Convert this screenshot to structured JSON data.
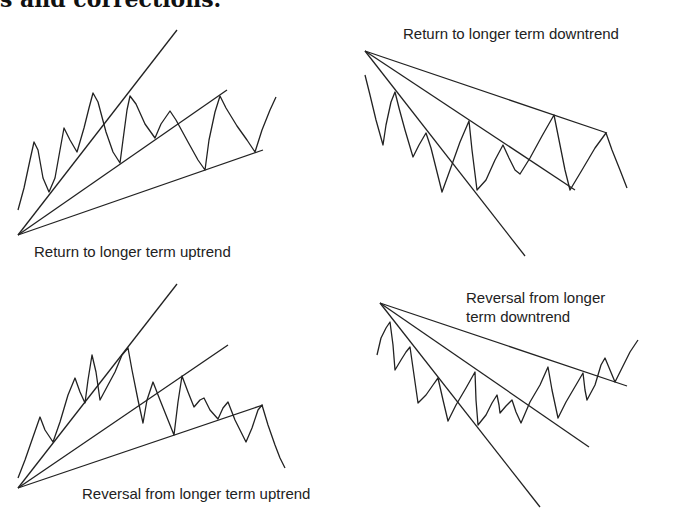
{
  "heading": "s and corrections.",
  "panels": [
    {
      "id": "return-uptrend",
      "caption": "Return to longer term uptrend",
      "caption_pos": [
        34,
        242
      ],
      "origin": [
        18,
        235
      ],
      "trendlines": [
        [
          177,
          30
        ],
        [
          227,
          90
        ],
        [
          263,
          150
        ]
      ],
      "price": [
        [
          18,
          210
        ],
        [
          24,
          188
        ],
        [
          30,
          160
        ],
        [
          34,
          142
        ],
        [
          38,
          150
        ],
        [
          43,
          178
        ],
        [
          49,
          192
        ],
        [
          55,
          178
        ],
        [
          60,
          150
        ],
        [
          64,
          128
        ],
        [
          70,
          140
        ],
        [
          77,
          152
        ],
        [
          84,
          128
        ],
        [
          89,
          108
        ],
        [
          93,
          93
        ],
        [
          98,
          102
        ],
        [
          106,
          132
        ],
        [
          113,
          152
        ],
        [
          120,
          163
        ],
        [
          123,
          140
        ],
        [
          127,
          110
        ],
        [
          130,
          96
        ],
        [
          136,
          104
        ],
        [
          145,
          124
        ],
        [
          155,
          138
        ],
        [
          161,
          124
        ],
        [
          170,
          111
        ],
        [
          176,
          120
        ],
        [
          188,
          142
        ],
        [
          198,
          160
        ],
        [
          205,
          170
        ],
        [
          209,
          140
        ],
        [
          215,
          112
        ],
        [
          220,
          96
        ],
        [
          226,
          108
        ],
        [
          237,
          126
        ],
        [
          247,
          140
        ],
        [
          255,
          152
        ],
        [
          262,
          130
        ],
        [
          270,
          110
        ],
        [
          276,
          97
        ]
      ]
    },
    {
      "id": "return-downtrend",
      "caption": "Return to longer term downtrend",
      "caption_pos": [
        403,
        24
      ],
      "origin": [
        365,
        51
      ],
      "trendlines": [
        [
          607,
          133
        ],
        [
          575,
          190
        ],
        [
          525,
          256
        ]
      ],
      "price": [
        [
          365,
          75
        ],
        [
          370,
          95
        ],
        [
          376,
          120
        ],
        [
          383,
          145
        ],
        [
          386,
          125
        ],
        [
          391,
          102
        ],
        [
          395,
          92
        ],
        [
          399,
          108
        ],
        [
          405,
          130
        ],
        [
          413,
          157
        ],
        [
          419,
          145
        ],
        [
          426,
          133
        ],
        [
          431,
          148
        ],
        [
          437,
          172
        ],
        [
          442,
          192
        ],
        [
          450,
          170
        ],
        [
          460,
          142
        ],
        [
          469,
          121
        ],
        [
          472,
          150
        ],
        [
          477,
          190
        ],
        [
          486,
          180
        ],
        [
          495,
          160
        ],
        [
          503,
          145
        ],
        [
          509,
          158
        ],
        [
          515,
          170
        ],
        [
          520,
          174
        ],
        [
          530,
          158
        ],
        [
          542,
          136
        ],
        [
          554,
          115
        ],
        [
          559,
          140
        ],
        [
          565,
          170
        ],
        [
          570,
          190
        ],
        [
          582,
          170
        ],
        [
          595,
          148
        ],
        [
          606,
          133
        ],
        [
          612,
          150
        ],
        [
          620,
          170
        ],
        [
          627,
          188
        ]
      ]
    },
    {
      "id": "reversal-uptrend",
      "caption": "Reversal from longer term uptrend",
      "caption_pos": [
        82,
        484
      ],
      "origin": [
        18,
        488
      ],
      "trendlines": [
        [
          177,
          284
        ],
        [
          228,
          345
        ],
        [
          263,
          405
        ]
      ],
      "price": [
        [
          18,
          478
        ],
        [
          25,
          460
        ],
        [
          33,
          437
        ],
        [
          40,
          417
        ],
        [
          45,
          430
        ],
        [
          53,
          442
        ],
        [
          60,
          422
        ],
        [
          68,
          395
        ],
        [
          75,
          378
        ],
        [
          80,
          392
        ],
        [
          85,
          403
        ],
        [
          88,
          380
        ],
        [
          92,
          355
        ],
        [
          96,
          372
        ],
        [
          100,
          400
        ],
        [
          108,
          385
        ],
        [
          115,
          372
        ],
        [
          122,
          355
        ],
        [
          128,
          348
        ],
        [
          132,
          370
        ],
        [
          138,
          400
        ],
        [
          143,
          423
        ],
        [
          147,
          400
        ],
        [
          153,
          382
        ],
        [
          160,
          400
        ],
        [
          168,
          420
        ],
        [
          174,
          435
        ],
        [
          178,
          402
        ],
        [
          182,
          376
        ],
        [
          188,
          392
        ],
        [
          194,
          407
        ],
        [
          200,
          400
        ],
        [
          204,
          398
        ],
        [
          210,
          410
        ],
        [
          218,
          419
        ],
        [
          223,
          408
        ],
        [
          228,
          402
        ],
        [
          235,
          420
        ],
        [
          241,
          432
        ],
        [
          246,
          442
        ],
        [
          252,
          428
        ],
        [
          258,
          410
        ],
        [
          262,
          405
        ],
        [
          268,
          425
        ],
        [
          275,
          445
        ],
        [
          280,
          458
        ],
        [
          285,
          468
        ]
      ]
    },
    {
      "id": "reversal-downtrend",
      "caption_lines": [
        "Reversal from longer",
        "term downtrend"
      ],
      "caption_pos": [
        466,
        288
      ],
      "origin": [
        380,
        303
      ],
      "trendlines": [
        [
          627,
          386
        ],
        [
          589,
          447
        ],
        [
          540,
          507
        ]
      ],
      "price": [
        [
          377,
          355
        ],
        [
          381,
          338
        ],
        [
          386,
          328
        ],
        [
          390,
          322
        ],
        [
          393,
          345
        ],
        [
          395,
          370
        ],
        [
          401,
          360
        ],
        [
          406,
          352
        ],
        [
          410,
          347
        ],
        [
          414,
          375
        ],
        [
          418,
          403
        ],
        [
          426,
          395
        ],
        [
          433,
          385
        ],
        [
          438,
          378
        ],
        [
          443,
          400
        ],
        [
          448,
          421
        ],
        [
          456,
          405
        ],
        [
          466,
          388
        ],
        [
          475,
          372
        ],
        [
          476,
          400
        ],
        [
          478,
          425
        ],
        [
          486,
          415
        ],
        [
          492,
          403
        ],
        [
          497,
          395
        ],
        [
          499,
          405
        ],
        [
          500,
          413
        ],
        [
          506,
          406
        ],
        [
          512,
          400
        ],
        [
          516,
          412
        ],
        [
          521,
          423
        ],
        [
          530,
          402
        ],
        [
          540,
          385
        ],
        [
          548,
          367
        ],
        [
          552,
          390
        ],
        [
          558,
          418
        ],
        [
          566,
          402
        ],
        [
          576,
          385
        ],
        [
          583,
          373
        ],
        [
          585,
          390
        ],
        [
          587,
          400
        ],
        [
          595,
          385
        ],
        [
          601,
          365
        ],
        [
          605,
          358
        ],
        [
          610,
          370
        ],
        [
          615,
          382
        ],
        [
          622,
          368
        ],
        [
          630,
          352
        ],
        [
          638,
          340
        ]
      ]
    }
  ],
  "colors": {
    "ink": "#222222",
    "background": "#ffffff"
  }
}
